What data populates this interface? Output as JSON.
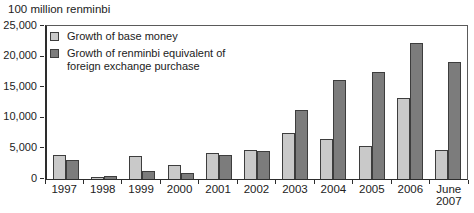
{
  "chart_data": {
    "type": "bar",
    "ylabel": "100 million renminbi",
    "categories": [
      "1997",
      "1998",
      "1999",
      "2000",
      "2001",
      "2002",
      "2003",
      "2004",
      "2005",
      "2006",
      "June 2007"
    ],
    "series": [
      {
        "key": "base-money",
        "name": "Growth of base money",
        "color": "#c9c9c9",
        "values": [
          3900,
          300,
          3700,
          2300,
          4300,
          4700,
          7500,
          6500,
          5400,
          13200,
          4700
        ]
      },
      {
        "key": "fx-purchase",
        "name": "Growth of renminbi equivalent of foreign exchange purchase",
        "color": "#7c7c7c",
        "values": [
          3100,
          500,
          1300,
          900,
          3900,
          4600,
          11300,
          16100,
          17500,
          22200,
          19100
        ]
      }
    ],
    "ylim": [
      0,
      25000
    ],
    "yticks": [
      {
        "value": 0,
        "label": "0"
      },
      {
        "value": 5000,
        "label": "5,000"
      },
      {
        "value": 10000,
        "label": "10,000"
      },
      {
        "value": 15000,
        "label": "15,000"
      },
      {
        "value": 20000,
        "label": "20,000"
      },
      {
        "value": 25000,
        "label": "25,000"
      }
    ],
    "grid": false,
    "legend_position": "top-left-inside",
    "bar_border_color": "#3d3d3d",
    "axis_color": "#2d2d2d"
  }
}
